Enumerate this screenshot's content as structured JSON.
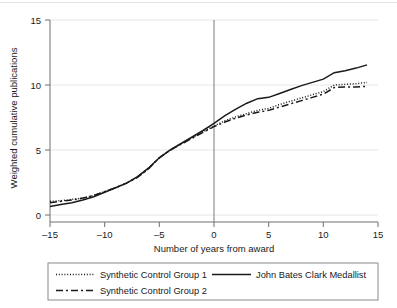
{
  "chart_data": {
    "type": "line",
    "title": "",
    "xlabel": "Number of years from award",
    "ylabel": "Weighted cumulative publications",
    "xlim": [
      -15,
      15
    ],
    "ylim": [
      0,
      15
    ],
    "xticks": [
      -15,
      -10,
      -5,
      0,
      5,
      10,
      15
    ],
    "xticklabels": [
      "–15",
      "–10",
      "–5",
      "0",
      "5",
      "10",
      "15"
    ],
    "yticks": [
      0,
      5,
      10,
      15
    ],
    "yticklabels": [
      "0",
      "5",
      "10",
      "15"
    ],
    "grid": "horizontal",
    "grid_color": "#e6e6e6",
    "reference_line_x": 0,
    "legend_position": "below-plot",
    "x": [
      -15,
      -14,
      -13,
      -12,
      -11,
      -10,
      -9,
      -8,
      -7,
      -6,
      -5,
      -4,
      -3,
      -2,
      -1,
      0,
      1,
      2,
      3,
      4,
      5,
      6,
      7,
      8,
      9,
      10,
      11,
      12,
      13,
      14
    ],
    "series": [
      {
        "name": "John Bates Clark Medallist",
        "style": "solid",
        "color": "#1a1a1a",
        "values": [
          0.65,
          0.8,
          0.95,
          1.15,
          1.4,
          1.75,
          2.1,
          2.45,
          2.95,
          3.6,
          4.4,
          5.0,
          5.5,
          6.0,
          6.5,
          7.05,
          7.65,
          8.15,
          8.6,
          8.95,
          9.05,
          9.35,
          9.65,
          9.95,
          10.2,
          10.45,
          10.95,
          11.1,
          11.3,
          11.55
        ]
      },
      {
        "name": "Synthetic Control Group 1",
        "style": "dotted",
        "color": "#1a1a1a",
        "values": [
          1.05,
          1.1,
          1.2,
          1.3,
          1.5,
          1.8,
          2.1,
          2.45,
          2.9,
          3.55,
          4.4,
          5.0,
          5.5,
          5.95,
          6.4,
          6.85,
          7.25,
          7.55,
          7.8,
          8.05,
          8.2,
          8.5,
          8.75,
          9.0,
          9.25,
          9.5,
          10.0,
          10.05,
          10.1,
          10.2
        ]
      },
      {
        "name": "Synthetic Control Group 2",
        "style": "dashed",
        "color": "#1a1a1a",
        "values": [
          0.95,
          1.05,
          1.15,
          1.3,
          1.5,
          1.8,
          2.1,
          2.45,
          2.9,
          3.55,
          4.4,
          5.0,
          5.45,
          5.9,
          6.35,
          6.8,
          7.15,
          7.45,
          7.7,
          7.9,
          8.05,
          8.3,
          8.55,
          8.8,
          9.05,
          9.3,
          9.8,
          9.85,
          9.85,
          9.9
        ]
      }
    ]
  },
  "legend": {
    "entries": [
      {
        "label": "Synthetic Control Group 1",
        "style": "dotted"
      },
      {
        "label": "John Bates Clark Medallist",
        "style": "solid"
      },
      {
        "label": "Synthetic Control Group 2",
        "style": "dashed"
      }
    ]
  }
}
